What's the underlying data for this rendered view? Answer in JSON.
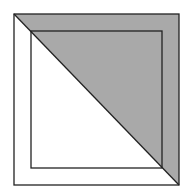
{
  "diagram": {
    "width": 190,
    "height": 195,
    "background": "#ffffff",
    "stroke_color": "#222222",
    "fill_color": "#a9a9a9",
    "outer_square": {
      "x1": 14,
      "y1": 14,
      "x2": 179,
      "y2": 185
    },
    "inner_square": {
      "x1": 31,
      "y1": 31,
      "x2": 162,
      "y2": 168
    },
    "diagonal": {
      "from": [
        14,
        14
      ],
      "to": [
        179,
        185
      ]
    },
    "shaded_region": "upper-right triangle of outer square above the diagonal",
    "shaded_points": "14,14 179,14 179,185"
  }
}
